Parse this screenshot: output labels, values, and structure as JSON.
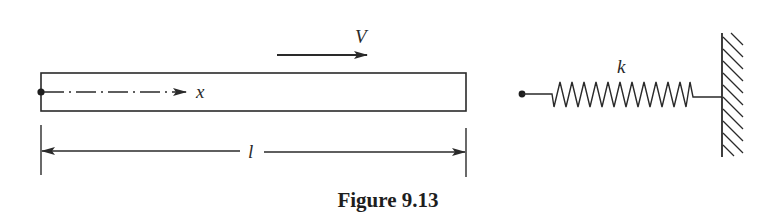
{
  "figure": {
    "caption": "Figure 9.13",
    "colors": {
      "ink": "#2a2a2a",
      "background": "#ffffff"
    },
    "bar": {
      "velocity_label": "V",
      "axis_label": "x",
      "length_label": "l"
    },
    "spring": {
      "stiffness_label": "k",
      "coils": 12,
      "support": "fixed-wall"
    }
  }
}
